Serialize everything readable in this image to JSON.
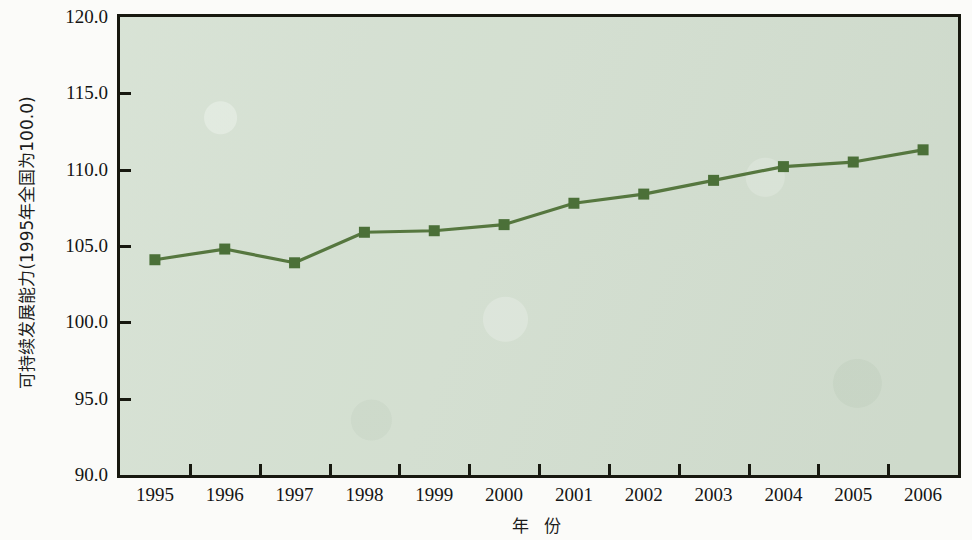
{
  "chart_data": {
    "type": "line",
    "title": "",
    "xlabel": "年 份",
    "ylabel": "可持续发展能力(1995年全国为100.0)",
    "categories": [
      "1995",
      "1996",
      "1997",
      "1998",
      "1999",
      "2000",
      "2001",
      "2002",
      "2003",
      "2004",
      "2005",
      "2006"
    ],
    "values": [
      104.1,
      104.8,
      103.9,
      105.9,
      106.0,
      106.4,
      107.8,
      108.4,
      109.3,
      110.2,
      110.5,
      111.3
    ],
    "series": [
      {
        "name": "可持续发展能力",
        "values": [
          104.1,
          104.8,
          103.9,
          105.9,
          106.0,
          106.4,
          107.8,
          108.4,
          109.3,
          110.2,
          110.5,
          111.3
        ]
      }
    ],
    "ylim": [
      90.0,
      120.0
    ],
    "y_ticks": [
      "90.0",
      "95.0",
      "100.0",
      "105.0",
      "110.0",
      "115.0",
      "120.0"
    ],
    "y_tick_values": [
      90.0,
      95.0,
      100.0,
      105.0,
      110.0,
      115.0,
      120.0
    ],
    "grid": false,
    "legend": "none",
    "marker": "square",
    "colors": {
      "line": "#56773f",
      "marker": "#4b7038",
      "plot_background": "#d4e0d1",
      "frame": "#17180f",
      "text": "#141414",
      "page_background": "#fbfbf9"
    }
  }
}
